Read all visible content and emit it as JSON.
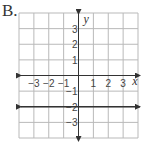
{
  "option_label": "B.",
  "chart_data": {
    "type": "line",
    "title": "",
    "xlabel": "x",
    "ylabel": "y",
    "xlim": [
      -4,
      4
    ],
    "ylim": [
      -4,
      4
    ],
    "grid": true,
    "x_tick_labels": [
      "−3",
      "−2",
      "−1",
      "1",
      "2",
      "3"
    ],
    "y_tick_labels": [
      "3",
      "2",
      "1",
      "−1",
      "−2",
      "−3"
    ],
    "series": [
      {
        "name": "y = -2",
        "x": [
          -4,
          4
        ],
        "values": [
          -2,
          -2
        ],
        "arrows_both_ends": true
      }
    ],
    "colors": {
      "grid": "#b9b9b9",
      "axis": "#333333",
      "line": "#333333"
    }
  }
}
